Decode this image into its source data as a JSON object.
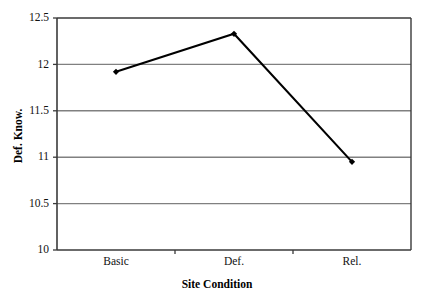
{
  "chart_data": {
    "type": "line",
    "title": "",
    "xlabel": "Site Condition",
    "ylabel": "Def. Know.",
    "categories": [
      "Basic",
      "Def.",
      "Rel."
    ],
    "values": [
      11.92,
      12.33,
      10.95
    ],
    "series": [
      {
        "name": "Def. Know.",
        "values": [
          11.92,
          12.33,
          10.95
        ]
      }
    ],
    "ylim": [
      10,
      12.5
    ],
    "ytick_labels": [
      "12.5",
      "12",
      "11.5",
      "11",
      "10.5",
      "10"
    ],
    "ytick_values": [
      12.5,
      12,
      11.5,
      11,
      10.5,
      10
    ],
    "xtick_labels": [
      "Basic",
      "Def.",
      "Rel."
    ],
    "grid": "horizontal",
    "legend": "none",
    "marker": "diamond",
    "line_color": "#000000",
    "grid_color": "#808080",
    "axis_color": "#3a3a3a",
    "background_color": "#ffffff"
  },
  "axes": {
    "y_title": "Def. Know.",
    "x_title": "Site Condition"
  },
  "ticks": {
    "y": [
      {
        "label": "12.5",
        "value": 12.5
      },
      {
        "label": "12",
        "value": 12
      },
      {
        "label": "11.5",
        "value": 11.5
      },
      {
        "label": "11",
        "value": 11
      },
      {
        "label": "10.5",
        "value": 10.5
      },
      {
        "label": "10",
        "value": 10
      }
    ],
    "x": [
      {
        "label": "Basic",
        "value": 0
      },
      {
        "label": "Def.",
        "value": 1
      },
      {
        "label": "Rel.",
        "value": 2
      }
    ]
  }
}
